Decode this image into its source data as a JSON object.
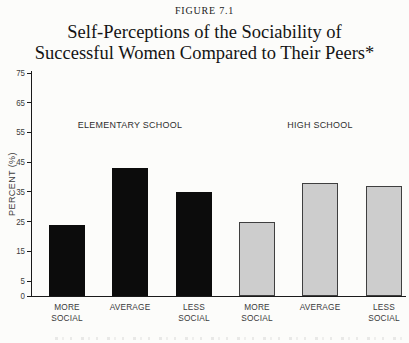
{
  "figure": {
    "label": "FIGURE 7.1",
    "title_line1": "Self-Perceptions of the Sociability of",
    "title_line2": "Successful Women Compared to Their Peers*"
  },
  "chart_data": {
    "type": "bar",
    "figure_label": "FIGURE 7.1",
    "title": "Self-Perceptions of the Sociability of Successful Women Compared to Their Peers*",
    "xlabel": "",
    "ylabel": "PERCENT (%)",
    "ylim": [
      0,
      75
    ],
    "yticks": [
      75,
      65,
      55,
      45,
      35,
      25,
      15,
      5,
      0
    ],
    "grid": false,
    "legend_position": "group labels above bars",
    "categories": [
      "MORE SOCIAL",
      "AVERAGE",
      "LESS SOCIAL"
    ],
    "series": [
      {
        "name": "ELEMENTARY SCHOOL",
        "color": "#0c0c0c",
        "values": [
          24,
          43,
          35
        ]
      },
      {
        "name": "HIGH SCHOOL",
        "color": "#cdcdcd",
        "values": [
          25,
          38,
          37
        ]
      }
    ],
    "footnote_visible": "partially cropped footnote line at bottom edge (illegible)"
  },
  "colors": {
    "background": "#fcfcfa",
    "axis": "#1a1a1a",
    "elementary_bar": "#0c0c0c",
    "high_school_bar_fill": "#cdcdcd",
    "high_school_bar_border": "#3f3f3f",
    "text": "#2e2e2e"
  }
}
